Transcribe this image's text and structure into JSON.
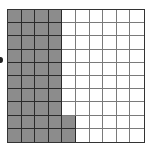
{
  "diagram": {
    "type": "hundred-grid",
    "rows": 10,
    "columns": 10,
    "total_cells": 100,
    "shaded_count": 42,
    "shaded_description": "First 4 columns fully shaded; 5th column shaded in bottom 2 rows",
    "shaded_cells": [
      [
        1,
        1,
        1,
        1,
        0,
        0,
        0,
        0,
        0,
        0
      ],
      [
        1,
        1,
        1,
        1,
        0,
        0,
        0,
        0,
        0,
        0
      ],
      [
        1,
        1,
        1,
        1,
        0,
        0,
        0,
        0,
        0,
        0
      ],
      [
        1,
        1,
        1,
        1,
        0,
        0,
        0,
        0,
        0,
        0
      ],
      [
        1,
        1,
        1,
        1,
        0,
        0,
        0,
        0,
        0,
        0
      ],
      [
        1,
        1,
        1,
        1,
        0,
        0,
        0,
        0,
        0,
        0
      ],
      [
        1,
        1,
        1,
        1,
        0,
        0,
        0,
        0,
        0,
        0
      ],
      [
        1,
        1,
        1,
        1,
        0,
        0,
        0,
        0,
        0,
        0
      ],
      [
        1,
        1,
        1,
        1,
        1,
        0,
        0,
        0,
        0,
        0
      ],
      [
        1,
        1,
        1,
        1,
        1,
        0,
        0,
        0,
        0,
        0
      ]
    ],
    "colors": {
      "shaded": "#8c8c8c",
      "unshaded": "#ffffff",
      "grid_line": "#333333"
    }
  }
}
